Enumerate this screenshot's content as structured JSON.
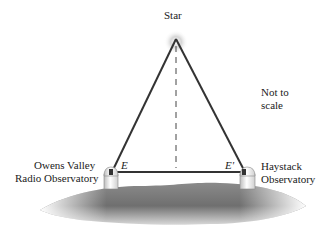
{
  "diagram": {
    "star_label": "Star",
    "note_line1": "Not to",
    "note_line2": "scale",
    "left_observatory": {
      "name_line1": "Owens Valley",
      "name_line2": "Radio Observatory",
      "point_label": "E"
    },
    "right_observatory": {
      "name_line1": "Haystack",
      "name_line2": "Observatory",
      "point_label": "E'"
    },
    "colors": {
      "line": "#333333",
      "ground_dark": "#6e6e6e",
      "ground_light": "#e8e8e8",
      "star_glow": "#c8c8c8"
    }
  }
}
